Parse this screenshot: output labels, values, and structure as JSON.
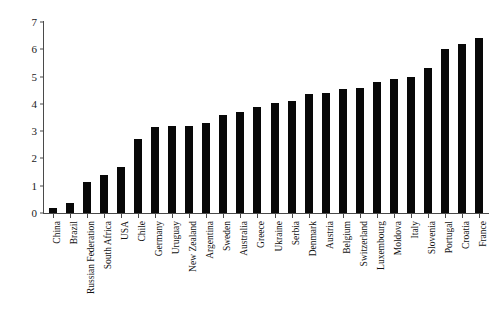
{
  "chart_data": {
    "type": "bar",
    "title": "",
    "subtitle": "",
    "xlabel": "",
    "ylabel": "",
    "ylim": [
      0,
      7
    ],
    "yticks": [
      0,
      1,
      2,
      3,
      4,
      5,
      6,
      7
    ],
    "grid": false,
    "legend": null,
    "bar_color": "#080808",
    "axis_color": "#4a4a4a",
    "categories": [
      "China",
      "Brazil",
      "Russian Federation",
      "South Africa",
      "USA",
      "Chile",
      "Germany",
      "Uruguay",
      "New Zealand",
      "Argentina",
      "Sweden",
      "Australia",
      "Greece",
      "Ukraine",
      "Serbia",
      "Denmark",
      "Austria",
      "Belgium",
      "Switzerland",
      "Luxembourg",
      "Moldova",
      "Italy",
      "Slovenia",
      "Portugal",
      "Croatia",
      "France"
    ],
    "values": [
      0.2,
      0.35,
      1.15,
      1.4,
      1.7,
      2.7,
      3.15,
      3.2,
      3.2,
      3.3,
      3.6,
      3.7,
      3.9,
      4.05,
      4.1,
      4.35,
      4.4,
      4.55,
      4.6,
      4.8,
      4.9,
      5.0,
      5.3,
      6.0,
      6.2,
      6.4
    ]
  }
}
